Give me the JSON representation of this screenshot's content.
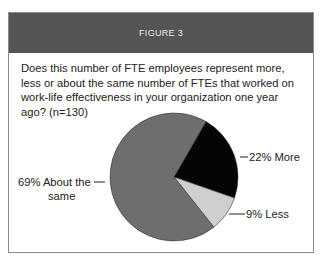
{
  "figure": {
    "header": "FIGURE 3",
    "question": "Does this number of FTE employees represent more, less or about the same number of FTEs that worked on work-life effectiveness in your organization one year ago? (n=130)"
  },
  "labels": {
    "more": "22% More",
    "less": "9% Less",
    "same_line1": "69% About the",
    "same_line2": "same"
  },
  "colors": {
    "header_bg": "#555555",
    "same": "#6e6e6e",
    "more": "#050505",
    "less": "#cfcfcf"
  },
  "chart_data": {
    "type": "pie",
    "title": "FIGURE 3",
    "subtitle": "Does this number of FTE employees represent more, less or about the same number of FTEs that worked on work-life effectiveness in your organization one year ago? (n=130)",
    "categories": [
      "More",
      "Less",
      "About the same"
    ],
    "values": [
      22,
      9,
      69
    ],
    "unit": "%",
    "n": 130,
    "legend_position": "inline labels with leader lines"
  }
}
